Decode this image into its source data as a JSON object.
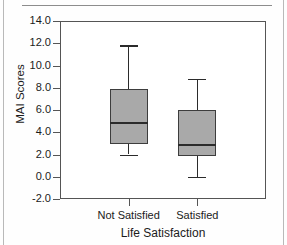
{
  "chart_data": {
    "type": "box",
    "title": "",
    "xlabel": "Life Satisfaction",
    "ylabel": "MAI Scores",
    "ylim": [
      -2.0,
      14.0
    ],
    "yticks": [
      "14.0",
      "12.0",
      "10.0",
      "8.0",
      "6.0",
      "4.0",
      "2.0",
      "0.0",
      "-2.0"
    ],
    "ytick_values": [
      14.0,
      12.0,
      10.0,
      8.0,
      6.0,
      4.0,
      2.0,
      0.0,
      -2.0
    ],
    "categories": [
      "Not Satisfied",
      "Satisfied"
    ],
    "grid": false,
    "legend": "none",
    "boxes": [
      {
        "category": "Not Satisfied",
        "whisker_low": 2.0,
        "q1": 2.9,
        "median": 4.9,
        "q3": 7.9,
        "whisker_high": 11.8
      },
      {
        "category": "Satisfied",
        "whisker_low": 0.0,
        "q1": 1.9,
        "median": 2.9,
        "q3": 6.0,
        "whisker_high": 8.8
      }
    ]
  },
  "colors": {
    "box_fill": "#a9a9a9",
    "box_stroke": "#3d3d3d",
    "axis": "#555555",
    "text": "#1b1b1b",
    "page_border": "#b9b9b9"
  }
}
